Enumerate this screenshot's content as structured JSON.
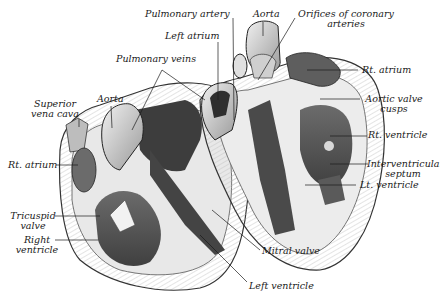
{
  "diagram": {
    "colors": {
      "ink": "#1a1a1a",
      "mid": "#7a7a7a",
      "light": "#d8d8d8",
      "paper": "#ffffff"
    },
    "labels": {
      "pulmonary_artery": "Pulmonary artery",
      "aorta_top": "Aorta",
      "orifices_line1": "Orifices of coronary",
      "orifices_line2": "arteries",
      "left_atrium": "Left atrium",
      "pulmonary_veins": "Pulmonary veins",
      "rt_atrium_right": "Rt. atrium",
      "aortic_valve_line1": "Aortic valve",
      "aortic_valve_line2": "cusps",
      "superior_line1": "Superior",
      "superior_line2": "vena cava",
      "aorta_left": "Aorta",
      "rt_ventricle": "Rt. ventricle",
      "rt_atrium_left": "Rt. atrium",
      "interventricular_line1": "Interventricular",
      "interventricular_line2": "septum",
      "lt_ventricle": "Lt. ventricle",
      "tricuspid_line1": "Tricuspid",
      "tricuspid_line2": "valve",
      "right_ventricle_line1": "Right",
      "right_ventricle_line2": "ventricle",
      "mitral_valve": "Mitral valve",
      "left_ventricle": "Left ventricle"
    }
  }
}
